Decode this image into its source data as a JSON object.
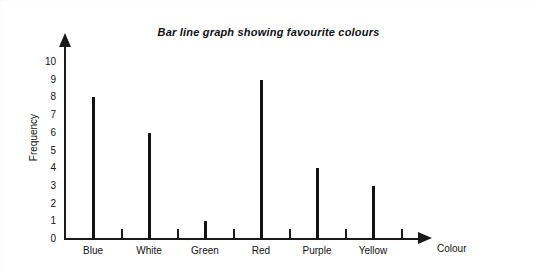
{
  "chart_data": {
    "type": "bar",
    "title": "Bar line graph showing favourite colours",
    "xlabel": "Colour",
    "ylabel": "Frequency",
    "categories": [
      "Blue",
      "White",
      "Green",
      "Red",
      "Purple",
      "Yellow"
    ],
    "values": [
      8,
      6,
      1,
      9,
      4,
      3
    ],
    "ylim": [
      0,
      10
    ],
    "y_ticks": [
      "10",
      "9",
      "8",
      "7",
      "6",
      "5",
      "4",
      "3",
      "2",
      "1",
      "0"
    ],
    "grid": false,
    "legend": null,
    "bar_color": "#111111",
    "axis_color": "#1a1a1a",
    "background": "#ffffff"
  }
}
